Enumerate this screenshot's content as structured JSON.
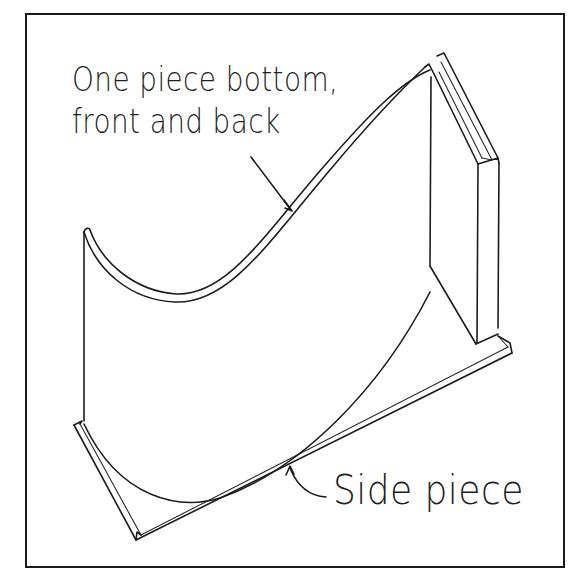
{
  "diagram": {
    "type": "isometric construction sketch",
    "labels": {
      "top_line1": "One piece bottom,",
      "top_line2": "front and back",
      "side": "Side piece"
    },
    "callouts": [
      {
        "label": "One piece bottom, front and back",
        "points_to": "curved top edge of bottom/front/back piece"
      },
      {
        "label": "Side piece",
        "points_to": "flat base board edge"
      }
    ],
    "colors": {
      "ink": "#1c1c1c",
      "paper": "#ffffff"
    }
  }
}
